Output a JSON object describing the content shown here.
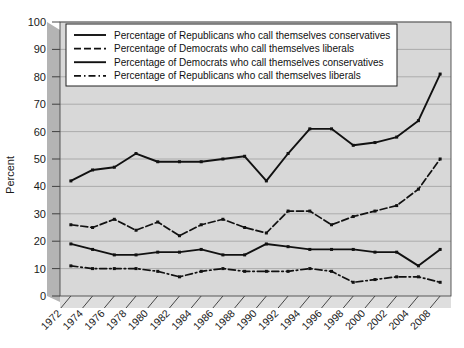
{
  "chart_data": {
    "type": "line",
    "title": "",
    "xlabel": "",
    "ylabel": "Percent",
    "ylim": [
      0,
      100
    ],
    "ytick_step": 10,
    "grid": true,
    "legend_position": "top-center",
    "categories": [
      "1972",
      "1974",
      "1976",
      "1978",
      "1980",
      "1982",
      "1984",
      "1986",
      "1988",
      "1990",
      "1992",
      "1994",
      "1996",
      "1998",
      "2000",
      "2002",
      "2004",
      "2008"
    ],
    "yticks": [
      "0",
      "10",
      "20",
      "30",
      "40",
      "50",
      "60",
      "70",
      "80",
      "90",
      "100"
    ],
    "series": [
      {
        "name": "Percentage of Republicans who call themselves conservatives",
        "style": "solid",
        "color": "#111111",
        "values": [
          42,
          46,
          47,
          52,
          49,
          49,
          49,
          50,
          51,
          42,
          52,
          61,
          61,
          55,
          56,
          58,
          64,
          81
        ]
      },
      {
        "name": "Percentage of Democrats who call themselves liberals",
        "style": "dashed",
        "color": "#111111",
        "values": [
          26,
          25,
          28,
          24,
          27,
          22,
          26,
          28,
          25,
          23,
          31,
          31,
          26,
          29,
          31,
          33,
          39,
          50
        ]
      },
      {
        "name": "Percentage of Democrats who call themselves conservatives",
        "style": "solid",
        "color": "#111111",
        "values": [
          19,
          17,
          15,
          15,
          16,
          16,
          17,
          15,
          15,
          19,
          18,
          17,
          17,
          17,
          16,
          16,
          11,
          17
        ]
      },
      {
        "name": "Percentage of Republicans who call themselves liberals",
        "style": "dashdot",
        "color": "#111111",
        "values": [
          11,
          10,
          10,
          10,
          9,
          7,
          9,
          10,
          9,
          9,
          9,
          10,
          9,
          5,
          6,
          7,
          7,
          5
        ]
      }
    ]
  },
  "legend": {
    "items": [
      {
        "label": "Percentage of Republicans who call themselves conservatives",
        "style": "solid"
      },
      {
        "label": "Percentage of Democrats who call themselves liberals",
        "style": "dashed"
      },
      {
        "label": "Percentage of Democrats who call themselves conservatives",
        "style": "solid"
      },
      {
        "label": "Percentage of Republicans who call themselves liberals",
        "style": "dashdot"
      }
    ]
  }
}
